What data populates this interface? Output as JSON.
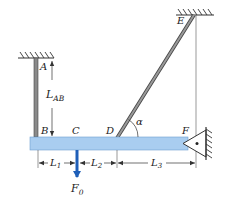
{
  "diagram": {
    "colors": {
      "beam": "#a9cdf0",
      "beam_edge": "#6f9fd0",
      "rod": "#8a8a8a",
      "rod_edge": "#444444",
      "force": "#1f5fb8",
      "line": "#333333",
      "hatch": "#333333"
    },
    "points": {
      "A": "A",
      "B": "B",
      "C": "C",
      "D": "D",
      "E": "E",
      "F": "F"
    },
    "dimensions": {
      "L_AB": {
        "main": "L",
        "sub": "AB"
      },
      "L1": {
        "main": "L",
        "sub": "1"
      },
      "L2": {
        "main": "L",
        "sub": "2"
      },
      "L3": {
        "main": "L",
        "sub": "3"
      }
    },
    "angle": {
      "label": "α"
    },
    "load": {
      "main": "F",
      "sub": "0"
    }
  }
}
